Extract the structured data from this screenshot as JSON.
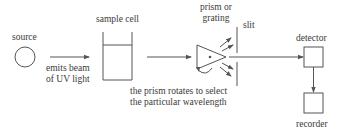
{
  "diagram": {
    "type": "flow",
    "colors": {
      "line": "#555555",
      "text": "#3a3a3a",
      "background": "#ffffff"
    },
    "nodes": {
      "source": {
        "label": "source",
        "shape": "circle"
      },
      "sample_cell": {
        "label": "sample cell",
        "shape": "open-container"
      },
      "prism": {
        "label_line1": "prism or",
        "label_line2": "grating",
        "shape": "triangle"
      },
      "slit": {
        "label": "slit",
        "shape": "slit"
      },
      "detector": {
        "label": "detector",
        "shape": "square"
      },
      "recorder": {
        "label": "recorder",
        "shape": "square"
      }
    },
    "annotations": {
      "beam_line1": "emits beam",
      "beam_line2": "of UV light",
      "prism_note_line1": "the prism rotates to select",
      "prism_note_line2": "the particular wavelength"
    },
    "edges": [
      {
        "from": "source",
        "to": "sample_cell"
      },
      {
        "from": "sample_cell",
        "to": "prism"
      },
      {
        "from": "prism",
        "to": "slit"
      },
      {
        "from": "slit",
        "to": "detector"
      },
      {
        "from": "detector",
        "to": "recorder"
      }
    ]
  }
}
